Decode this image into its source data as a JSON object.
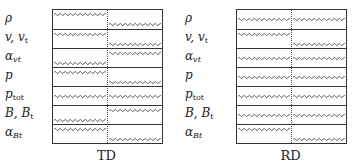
{
  "figure": {
    "panels": [
      {
        "id": "td",
        "caption": "TD",
        "rows": [
          {
            "label_main": "ρ",
            "label_sub": "",
            "left": "top",
            "right": "bottom"
          },
          {
            "label_main": "v, v",
            "label_sub": "t",
            "left": "top",
            "right": "bottom"
          },
          {
            "label_main": "α",
            "label_sub": "vt",
            "left": "bottom",
            "right": "top"
          },
          {
            "label_main": "p",
            "label_sub": "",
            "left": "top",
            "right": "bottom"
          },
          {
            "label_main": "p",
            "label_sub": "tot",
            "left": "middle",
            "right": "middle"
          },
          {
            "label_main": "B, B",
            "label_sub": "t",
            "left": "bottom",
            "right": "top"
          },
          {
            "label_main": "α",
            "label_sub": "Bt",
            "left": "top",
            "right": "bottom"
          }
        ]
      },
      {
        "id": "rd",
        "caption": "RD",
        "rows": [
          {
            "label_main": "ρ",
            "label_sub": "",
            "left": "middle",
            "right": "middle"
          },
          {
            "label_main": "v, v",
            "label_sub": "t",
            "left": "top",
            "right": "bottom"
          },
          {
            "label_main": "α",
            "label_sub": "vt",
            "left": "middle",
            "right": "middle"
          },
          {
            "label_main": "p",
            "label_sub": "",
            "left": "middle",
            "right": "middle"
          },
          {
            "label_main": "p",
            "label_sub": "tot",
            "left": "middle",
            "right": "middle"
          },
          {
            "label_main": "B, B",
            "label_sub": "t",
            "left": "middle",
            "right": "middle"
          },
          {
            "label_main": "α",
            "label_sub": "Bt",
            "left": "top",
            "right": "bottom"
          }
        ]
      }
    ],
    "colors": {
      "line": "#333333",
      "wave": "#444444",
      "text": "#222222"
    }
  }
}
